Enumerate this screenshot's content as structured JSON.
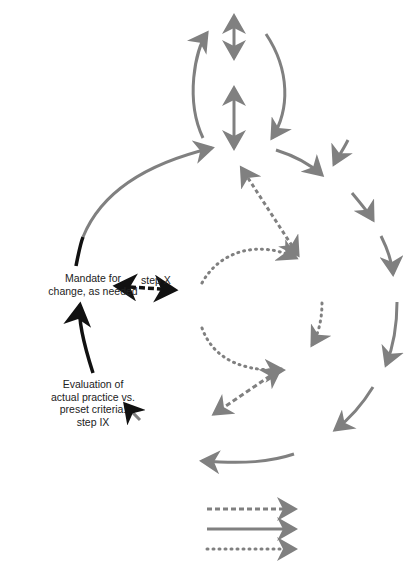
{
  "labels": {
    "mandate": "Mandate for\nchange, as needed",
    "mandate_line1": "Mandate for",
    "mandate_line2": "change, as needed",
    "step_x": "step X",
    "evaluation_line1": "Evaluation of",
    "evaluation_line2": "actual practice vs.",
    "evaluation_line3": "preset criteria:",
    "evaluation_line4": "step IX"
  },
  "colors": {
    "gray_arrow": "#808080",
    "black_arrow": "#111111",
    "background": "#ffffff"
  },
  "legend": {
    "items": [
      {
        "style": "dashed",
        "color": "#808080"
      },
      {
        "style": "solid",
        "color": "#808080"
      },
      {
        "style": "dotted",
        "color": "#808080"
      }
    ]
  }
}
